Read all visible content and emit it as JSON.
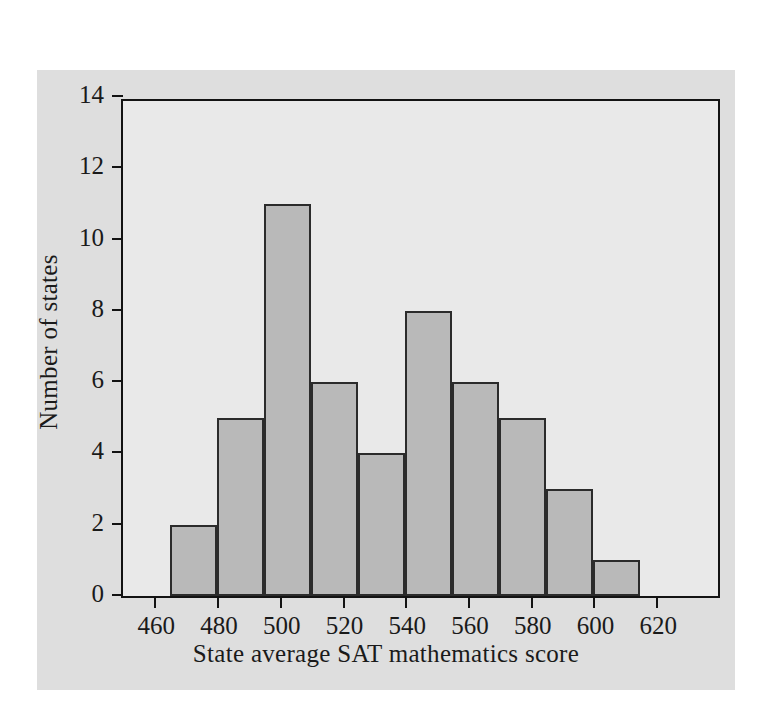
{
  "chart_data": {
    "type": "bar",
    "title": "",
    "xlabel": "State average SAT mathematics score",
    "ylabel": "Number of states",
    "xlim": [
      450,
      641
    ],
    "ylim": [
      0,
      14
    ],
    "grid": false,
    "legend": null,
    "bin_width": 15,
    "bin_edges": [
      465,
      480,
      495,
      510,
      525,
      540,
      555,
      570,
      585,
      600,
      615
    ],
    "categories": [
      "465-480",
      "480-495",
      "495-510",
      "510-525",
      "525-540",
      "540-555",
      "555-570",
      "570-585",
      "585-600",
      "600-615"
    ],
    "values": [
      2,
      5,
      11,
      6,
      4,
      8,
      6,
      5,
      3,
      1
    ],
    "xticks": [
      460,
      480,
      500,
      520,
      540,
      560,
      580,
      600,
      620
    ],
    "xtick_labels": [
      "460",
      "480",
      "500",
      "520",
      "540",
      "560",
      "580",
      "600",
      "620"
    ],
    "yticks": [
      0,
      2,
      4,
      6,
      8,
      10,
      12,
      14
    ],
    "ytick_labels": [
      "0",
      "2",
      "4",
      "6",
      "8",
      "10",
      "12",
      "14"
    ],
    "colors": {
      "bar_fill": "#b9b9b9",
      "bar_edge": "#2b2b2b",
      "plot_background": "#e9e9e9",
      "figure_background": "#dedede",
      "axis": "#131313",
      "text": "#1a1a1a"
    }
  }
}
